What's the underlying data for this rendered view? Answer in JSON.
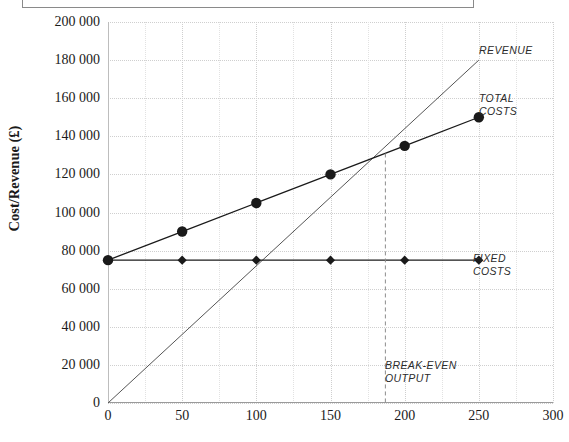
{
  "chart_data": {
    "type": "line",
    "title": "",
    "xlabel": "",
    "ylabel": "Cost/Revenue (£)",
    "xlim": [
      0,
      300
    ],
    "ylim": [
      0,
      200000
    ],
    "grid": true,
    "legend_position": "inline-right",
    "x_ticks": [
      "0",
      "50",
      "100",
      "150",
      "200",
      "250",
      "300"
    ],
    "x_tick_values": [
      0,
      50,
      100,
      150,
      200,
      250,
      300
    ],
    "y_ticks": [
      "0",
      "20 000",
      "40 000",
      "60 000",
      "80 000",
      "100 000",
      "120 000",
      "140 000",
      "160 000",
      "180 000",
      "200 000"
    ],
    "y_tick_values": [
      0,
      20000,
      40000,
      60000,
      80000,
      100000,
      120000,
      140000,
      160000,
      180000,
      200000
    ],
    "series": [
      {
        "name": "REVENUE",
        "marker": "none",
        "color": "#555555",
        "x": [
          0,
          250
        ],
        "values": [
          0,
          180000
        ]
      },
      {
        "name": "TOTAL COSTS",
        "marker": "circle",
        "color": "#1a1a1a",
        "x": [
          0,
          50,
          100,
          150,
          200,
          250
        ],
        "values": [
          75000,
          90000,
          105000,
          120000,
          135000,
          150000
        ]
      },
      {
        "name": "FIXED COSTS",
        "marker": "diamond",
        "color": "#1a1a1a",
        "x": [
          0,
          50,
          100,
          150,
          200,
          250
        ],
        "values": [
          75000,
          75000,
          75000,
          75000,
          75000,
          75000
        ]
      }
    ],
    "annotations": [
      {
        "name": "revenue",
        "text": "REVENUE"
      },
      {
        "name": "total-costs",
        "text": "TOTAL\nCOSTS"
      },
      {
        "name": "fixed-costs",
        "text": "FIXED\nCOSTS"
      },
      {
        "name": "break-even",
        "text": "BREAK-EVEN\nOUTPUT"
      }
    ],
    "break_even": {
      "label": "BREAK-EVEN\nOUTPUT",
      "x": 187,
      "y": 131000,
      "guide_line": "dashed-vertical"
    },
    "colors": {
      "axis": "#9a9a9a",
      "grid": "#cfcfcf",
      "series": "#1a1a1a",
      "annotation": "#2b2b2b"
    }
  }
}
